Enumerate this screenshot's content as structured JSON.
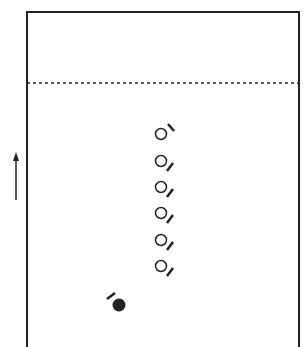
{
  "diagram": {
    "type": "play-diagram",
    "colors": {
      "stroke": "#222222",
      "background": "#ffffff"
    },
    "frame": {
      "left": 27,
      "right": 299,
      "top": 12,
      "bottom": 347
    },
    "dashed_line": {
      "y": 83
    },
    "direction_arrow": {
      "x": 16,
      "y_start": 200,
      "y_end": 152,
      "direction": "up"
    },
    "open_players": [
      {
        "cx": 161,
        "cy": 134,
        "tick": "up-right"
      },
      {
        "cx": 161,
        "cy": 161,
        "tick": "down-right"
      },
      {
        "cx": 161,
        "cy": 187,
        "tick": "down-right"
      },
      {
        "cx": 161,
        "cy": 213,
        "tick": "down-right"
      },
      {
        "cx": 161,
        "cy": 240,
        "tick": "down-right"
      },
      {
        "cx": 161,
        "cy": 266,
        "tick": "down-right"
      }
    ],
    "filled_player": {
      "cx": 119,
      "cy": 305,
      "tick": "up-left"
    }
  }
}
